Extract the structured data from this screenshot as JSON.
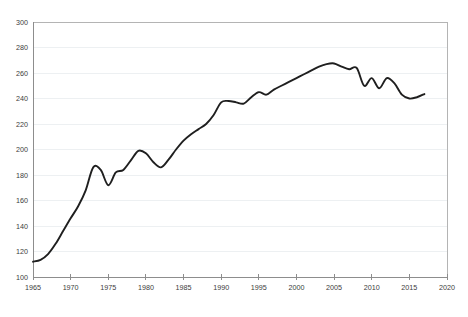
{
  "chart_data": {
    "type": "line",
    "title": "",
    "subtitle": "",
    "xlabel": "",
    "ylabel": "",
    "xlim": [
      1965,
      2020
    ],
    "ylim": [
      100,
      300
    ],
    "grid": true,
    "legend": false,
    "legend_position": "none",
    "line_color": "#1f1f1f",
    "grid_color": "#e9ecef",
    "axis_color": "#8d8d8d",
    "background_color": "#ffffff",
    "x_ticks": [
      1965,
      1970,
      1975,
      1980,
      1985,
      1990,
      1995,
      2000,
      2005,
      2010,
      2015,
      2020
    ],
    "x_tick_labels": [
      "1965",
      "1970",
      "1975",
      "1980",
      "1985",
      "1990",
      "1995",
      "2000",
      "2005",
      "2010",
      "2015",
      "2020"
    ],
    "y_ticks": [
      100,
      120,
      140,
      160,
      180,
      200,
      220,
      240,
      260,
      280,
      300
    ],
    "y_tick_labels": [
      "100",
      "120",
      "140",
      "160",
      "180",
      "200",
      "220",
      "240",
      "260",
      "280",
      "300"
    ],
    "series": [
      {
        "name": "series-1",
        "x": [
          1965,
          1966,
          1967,
          1968,
          1969,
          1970,
          1971,
          1972,
          1973,
          1974,
          1975,
          1976,
          1977,
          1978,
          1979,
          1980,
          1981,
          1982,
          1983,
          1984,
          1985,
          1986,
          1987,
          1988,
          1989,
          1990,
          1991,
          1992,
          1993,
          1994,
          1995,
          1996,
          1997,
          1998,
          1999,
          2000,
          2001,
          2002,
          2003,
          2004,
          2005,
          2006,
          2007,
          2008,
          2009,
          2010,
          2011,
          2012,
          2013,
          2014,
          2015,
          2016,
          2017
        ],
        "values": [
          112,
          113.5,
          118,
          126,
          136,
          146,
          155.5,
          168,
          186,
          184,
          172,
          182,
          184,
          191.5,
          199,
          197,
          190,
          186,
          192,
          200,
          207,
          212,
          216,
          220,
          227,
          237,
          238,
          237,
          236,
          241,
          245,
          243,
          247,
          250,
          253,
          256,
          259,
          262,
          265,
          267,
          267.5,
          265,
          263,
          264,
          250,
          256,
          248,
          256,
          252,
          243,
          240,
          241,
          243.5
        ]
      }
    ]
  }
}
